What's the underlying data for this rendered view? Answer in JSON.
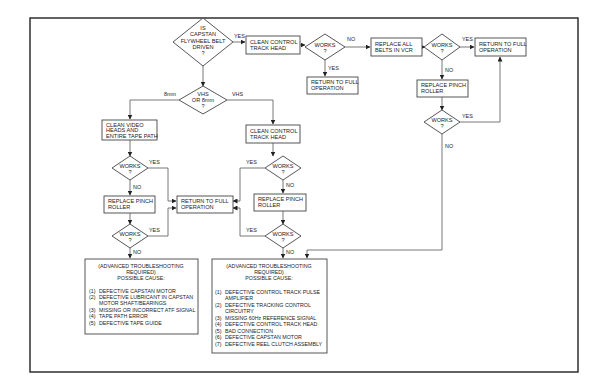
{
  "flowchart": {
    "decisions": {
      "belt_driven": [
        "IS",
        "CAPSTAN",
        "FLYWHEEL BELT",
        "DRIVEN",
        "?"
      ],
      "vhs_8mm": [
        "VHS",
        "OR 8mm",
        "?"
      ],
      "works": [
        "WORKS",
        "?"
      ]
    },
    "boxes": {
      "clean_control_top": [
        "CLEAN CONTROL",
        "TRACK HEAD"
      ],
      "return_full": [
        "RETURN TO FULL",
        "OPERATION"
      ],
      "replace_belts": [
        "REPLACE ALL",
        "BELTS IN VCR"
      ],
      "replace_pinch": [
        "REPLACE PINCH",
        "ROLLER"
      ],
      "clean_video": [
        "CLEAN VIDEO",
        "HEADS AND",
        "ENTIRE TAPE PATH"
      ],
      "clean_control_vhs": [
        "CLEAN CONTROL",
        "TRACK HEAD"
      ]
    },
    "labels": {
      "yes": "YES",
      "no": "NO",
      "vhs": "VHS",
      "eight_mm": "8mm"
    },
    "advanced_8mm": {
      "header": [
        "(ADVANCED TROUBLESHOOTING",
        "REQUIRED)",
        "POSSIBLE CAUSE:"
      ],
      "causes": [
        [
          "(1)",
          "DEFECTIVE CAPSTAN MOTOR"
        ],
        [
          "(2)",
          "DEFECTIVE LUBRICANT IN CAPSTAN"
        ],
        [
          "",
          "MOTOR SHAFT/BEARINGS"
        ],
        [
          "(3)",
          "MISSING OR INCORRECT ATF SIGNAL"
        ],
        [
          "(4)",
          "TAPE PATH ERROR"
        ],
        [
          "(5)",
          "DEFECTIVE TAPE GUIDE"
        ]
      ]
    },
    "advanced_vhs": {
      "header": [
        "(ADVANCED TROUBLESHOOTING",
        "REQUIRED)",
        "POSSIBLE CAUSE:"
      ],
      "causes": [
        [
          "(1)",
          "DEFECTIVE CONTROL TRACK PULSE"
        ],
        [
          "",
          "AMPLIFIER"
        ],
        [
          "(2)",
          "DEFECTIVE TRACKING CONTROL"
        ],
        [
          "",
          "CIRCUITRY"
        ],
        [
          "(3)",
          "MISSING 60Hz REFERENCE SIGNAL"
        ],
        [
          "(4)",
          "DEFECTIVE CONTROL TRACK HEAD"
        ],
        [
          "(5)",
          "BAD CONNECTION"
        ],
        [
          "(6)",
          "DEFECTIVE CAPSTAN MOTOR"
        ],
        [
          "(7)",
          "DEFECTIVE REEL CLUTCH ASSEMBLY"
        ]
      ]
    }
  }
}
